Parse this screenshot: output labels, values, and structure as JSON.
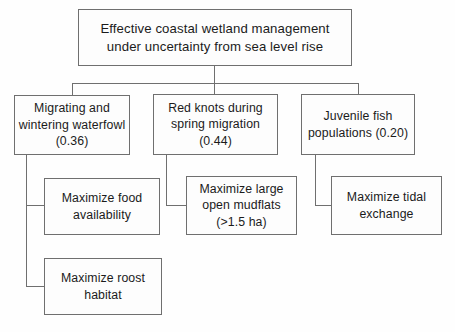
{
  "diagram": {
    "type": "objectives-hierarchy",
    "title_node": {
      "id": "goal",
      "level": 1,
      "text": "Effective coastal wetland management under uncertainty from sea level rise",
      "line_1": "Effective coastal wetland management",
      "line_2": "under uncertainty from sea level rise"
    },
    "objectives": [
      {
        "id": "obj-1",
        "level": 2,
        "text": "Migrating and wintering waterfowl (0.36)",
        "label": "Migrating and wintering waterfowl",
        "weight": "0.36",
        "weight_display": "(0.36)"
      },
      {
        "id": "obj-2",
        "level": 2,
        "text": "Red knots during spring migration (0.44)",
        "label": "Red knots during spring migration",
        "weight": "0.44",
        "weight_display": "(0.44)"
      },
      {
        "id": "obj-3",
        "level": 2,
        "text": "Juvenile fish populations (0.20)",
        "label": "Juvenile fish populations",
        "weight": "0.20",
        "weight_display": "(0.20)"
      }
    ],
    "attributes": [
      {
        "id": "attr-1",
        "level": 3,
        "parent": "obj-1",
        "text": "Maximize food availability"
      },
      {
        "id": "attr-4",
        "level": 3,
        "parent": "obj-1",
        "text": "Maximize roost habitat"
      },
      {
        "id": "attr-2",
        "level": 3,
        "parent": "obj-2",
        "text": "Maximize large open mudflats (>1.5 ha)",
        "threshold": ">1.5 ha"
      },
      {
        "id": "attr-3",
        "level": 3,
        "parent": "obj-3",
        "text": "Maximize tidal exchange"
      }
    ],
    "style": {
      "border_color": "#6f6f6f",
      "box_fill": "#fdfdfd",
      "text_color": "#1b1b1b",
      "canvas_background": "#fefefe"
    }
  }
}
